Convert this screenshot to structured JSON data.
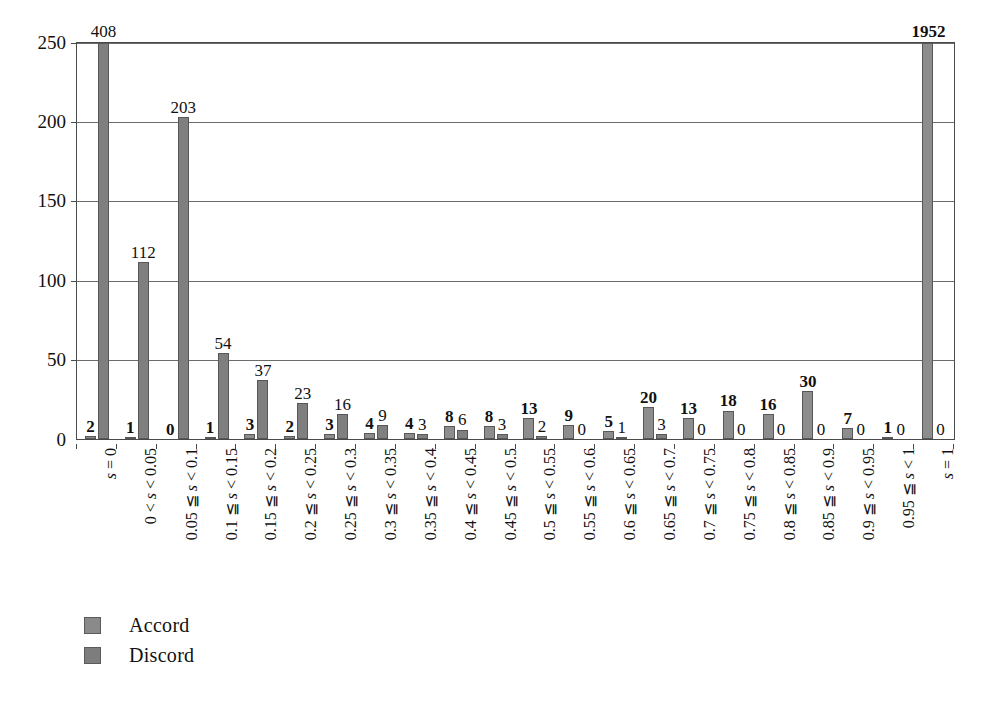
{
  "chart_data": {
    "type": "bar",
    "title": "",
    "xlabel": "",
    "ylabel": "",
    "ylim": [
      0,
      250
    ],
    "yticks": [
      0,
      50,
      100,
      150,
      200,
      250
    ],
    "grid": true,
    "legend_position": "bottom-left",
    "categories": [
      "s = 0",
      "0 < s < 0.05",
      "0.05 ≦ s < 0.1",
      "0.1 ≦ s < 0.15",
      "0.15 ≦ s < 0.2",
      "0.2 ≦ s < 0.25",
      "0.25 ≦ s < 0.3",
      "0.3 ≦ s < 0.35",
      "0.35 ≦ s < 0.4",
      "0.4 ≦ s < 0.45",
      "0.45 ≦ s < 0.5",
      "0.5 ≦ s < 0.55",
      "0.55 ≦ s < 0.6",
      "0.6 ≦ s < 0.65",
      "0.65 ≦ s < 0.7",
      "0.7 ≦ s < 0.75",
      "0.75 ≦ s < 0.8",
      "0.8 ≦ s < 0.85",
      "0.85 ≦ s < 0.9",
      "0.9 ≦ s < 0.95",
      "0.95 ≦ s < 1",
      "s = 1"
    ],
    "series": [
      {
        "name": "Accord",
        "values": [
          2,
          1,
          0,
          1,
          3,
          2,
          3,
          4,
          4,
          8,
          8,
          13,
          9,
          5,
          20,
          13,
          18,
          16,
          30,
          7,
          1,
          1952
        ]
      },
      {
        "name": "Discord",
        "values": [
          408,
          112,
          203,
          54,
          37,
          23,
          16,
          9,
          3,
          6,
          3,
          2,
          0,
          1,
          3,
          0,
          0,
          0,
          0,
          0,
          0,
          0
        ]
      }
    ]
  },
  "legend": {
    "items": [
      {
        "label": "Accord",
        "color": "#8d8d8d"
      },
      {
        "label": "Discord",
        "color": "#7d7d7d"
      }
    ]
  },
  "axis": {
    "y_tick_labels": [
      "250",
      "200",
      "150",
      "100",
      "50",
      "0"
    ]
  }
}
